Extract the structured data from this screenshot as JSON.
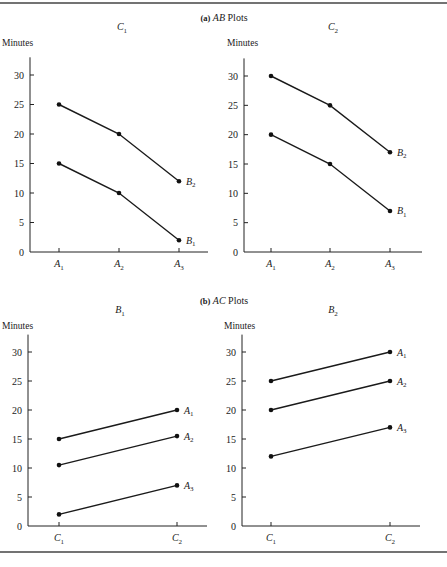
{
  "figure": {
    "section_titles": [
      {
        "prefix": "(a)",
        "italic": "AB",
        "suffix": "Plots"
      },
      {
        "prefix": "(b)",
        "italic": "AC",
        "suffix": "Plots"
      }
    ]
  },
  "chart_data": [
    {
      "type": "line",
      "group": "(a) AB Plots",
      "title": "C1",
      "title_base": "C",
      "title_sub": "1",
      "ylabel": "Minutes",
      "xlabel": "",
      "ylim": [
        0,
        33
      ],
      "yticks": [
        0,
        5,
        10,
        15,
        20,
        25,
        30
      ],
      "categories": [
        "A1",
        "A2",
        "A3"
      ],
      "category_parts": [
        [
          "A",
          "1"
        ],
        [
          "A",
          "2"
        ],
        [
          "A",
          "3"
        ]
      ],
      "series": [
        {
          "name": "B2",
          "name_base": "B",
          "name_sub": "2",
          "values": [
            25,
            20,
            12
          ]
        },
        {
          "name": "B1",
          "name_base": "B",
          "name_sub": "1",
          "values": [
            15,
            10,
            2
          ]
        }
      ],
      "grid": false,
      "legend": "line-end labels"
    },
    {
      "type": "line",
      "group": "(a) AB Plots",
      "title": "C2",
      "title_base": "C",
      "title_sub": "2",
      "ylabel": "Minutes",
      "xlabel": "",
      "ylim": [
        0,
        33
      ],
      "yticks": [
        0,
        5,
        10,
        15,
        20,
        25,
        30
      ],
      "categories": [
        "A1",
        "A2",
        "A3"
      ],
      "category_parts": [
        [
          "A",
          "1"
        ],
        [
          "A",
          "2"
        ],
        [
          "A",
          "3"
        ]
      ],
      "series": [
        {
          "name": "B2",
          "name_base": "B",
          "name_sub": "2",
          "values": [
            30,
            25,
            17
          ]
        },
        {
          "name": "B1",
          "name_base": "B",
          "name_sub": "1",
          "values": [
            20,
            15,
            7
          ]
        }
      ],
      "grid": false,
      "legend": "line-end labels"
    },
    {
      "type": "line",
      "group": "(b) AC Plots",
      "title": "B1",
      "title_base": "B",
      "title_sub": "1",
      "ylabel": "Minutes",
      "xlabel": "",
      "ylim": [
        0,
        33
      ],
      "yticks": [
        0,
        5,
        10,
        15,
        20,
        25,
        30
      ],
      "categories": [
        "C1",
        "C2"
      ],
      "category_parts": [
        [
          "C",
          "1"
        ],
        [
          "C",
          "2"
        ]
      ],
      "series": [
        {
          "name": "A1",
          "name_base": "A",
          "name_sub": "1",
          "values": [
            15,
            20
          ]
        },
        {
          "name": "A2",
          "name_base": "A",
          "name_sub": "2",
          "values": [
            10.5,
            15.5
          ]
        },
        {
          "name": "A3",
          "name_base": "A",
          "name_sub": "3",
          "values": [
            2,
            7
          ]
        }
      ],
      "grid": false,
      "legend": "line-end labels"
    },
    {
      "type": "line",
      "group": "(b) AC Plots",
      "title": "B2",
      "title_base": "B",
      "title_sub": "2",
      "ylabel": "Minutes",
      "xlabel": "",
      "ylim": [
        0,
        33
      ],
      "yticks": [
        0,
        5,
        10,
        15,
        20,
        25,
        30
      ],
      "categories": [
        "C1",
        "C2"
      ],
      "category_parts": [
        [
          "C",
          "1"
        ],
        [
          "C",
          "2"
        ]
      ],
      "series": [
        {
          "name": "A1",
          "name_base": "A",
          "name_sub": "1",
          "values": [
            25,
            30
          ]
        },
        {
          "name": "A2",
          "name_base": "A",
          "name_sub": "2",
          "values": [
            20,
            25
          ]
        },
        {
          "name": "A3",
          "name_base": "A",
          "name_sub": "3",
          "values": [
            12,
            17
          ]
        }
      ],
      "grid": false,
      "legend": "line-end labels"
    }
  ]
}
